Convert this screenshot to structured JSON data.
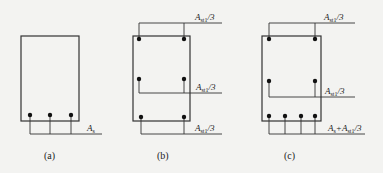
{
  "figure": {
    "panels": [
      {
        "caption": "(a)",
        "labels": [
          {
            "main": "A",
            "sub": "s",
            "rest": ""
          }
        ]
      },
      {
        "caption": "(b)",
        "labels": [
          {
            "main": "A",
            "sub": "st1",
            "rest": "/3"
          },
          {
            "main": "A",
            "sub": "st1",
            "rest": "/3"
          },
          {
            "main": "A",
            "sub": "st1",
            "rest": "/3"
          }
        ]
      },
      {
        "caption": "(c)",
        "labels": [
          {
            "main": "A",
            "sub": "st1",
            "rest": "/3"
          },
          {
            "main": "A",
            "sub": "st1",
            "rest": "/3"
          },
          {
            "main": "A",
            "sub": "s",
            "rest": "+A",
            "sub2": "st1",
            "rest2": "/3"
          }
        ]
      }
    ],
    "colors": {
      "line": "#333333",
      "background": "#f3f3f1"
    }
  }
}
